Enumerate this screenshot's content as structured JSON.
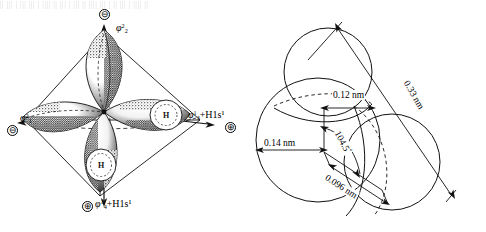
{
  "figure": {
    "scan_sliver_text": "|| ||| | ||| ||| | |||| || ||| | ||| || |||| ||| | || ||| | |||| ||",
    "panels": [
      {
        "id": "orbital",
        "name": "sp3-hybrid-orbital-tetrahedron"
      },
      {
        "id": "spacefill",
        "name": "water-space-filling-model"
      }
    ]
  },
  "orbital_panel": {
    "axis_labels": [
      {
        "id": "top",
        "phi": "φ",
        "sub": "2",
        "sup": "2",
        "suffix": "",
        "charge": "⊖"
      },
      {
        "id": "left",
        "phi": "φ",
        "sub": "1",
        "sup": "2",
        "suffix": "",
        "charge": "⊖"
      },
      {
        "id": "right",
        "phi": "φ",
        "sub": "3",
        "sup": "1",
        "suffix": "+H1s¹",
        "charge": "⊕"
      },
      {
        "id": "bottom",
        "phi": "φ",
        "sub": "4",
        "sup": "1",
        "suffix": "+H1s¹",
        "charge": "⊕"
      }
    ],
    "atom_labels": [
      {
        "id": "h-right",
        "text": "H"
      },
      {
        "id": "h-bottom",
        "text": "H"
      }
    ],
    "charge_minus": "⊖",
    "charge_plus": "⊕"
  },
  "spacefill_panel": {
    "dimensions": [
      {
        "id": "d-012",
        "label": "0.12 nm",
        "value": 0.12,
        "unit": "nm"
      },
      {
        "id": "d-033",
        "label": "0.33 nm",
        "value": 0.33,
        "unit": "nm"
      },
      {
        "id": "d-014",
        "label": "0.14 nm",
        "value": 0.14,
        "unit": "nm"
      },
      {
        "id": "d-0096",
        "label": "0.096 nm",
        "value": 0.096,
        "unit": "nm"
      }
    ],
    "angle": {
      "id": "bond-angle",
      "value": "104.5",
      "degree": "°",
      "label": "104.5°"
    }
  },
  "colors": {
    "ink": "#111111",
    "paper": "#ffffff"
  }
}
